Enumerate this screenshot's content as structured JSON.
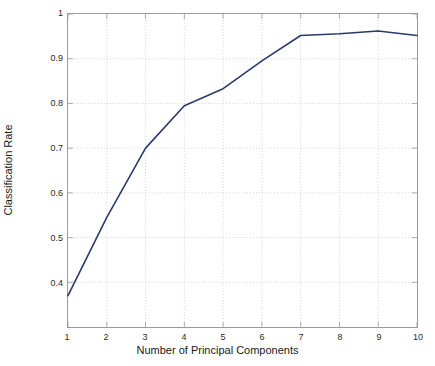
{
  "chart_data": {
    "type": "line",
    "title": "",
    "xlabel": "Number of Principal Components",
    "ylabel": "Classification Rate",
    "x": [
      1,
      2,
      3,
      4,
      5,
      6,
      7,
      8,
      9,
      10
    ],
    "values": [
      0.37,
      0.545,
      0.7,
      0.795,
      0.833,
      0.895,
      0.952,
      0.956,
      0.962,
      0.952
    ],
    "series": [
      {
        "name": "Classification Rate",
        "color": "#2a3a6b",
        "values": [
          0.37,
          0.545,
          0.7,
          0.795,
          0.833,
          0.895,
          0.952,
          0.956,
          0.962,
          0.952
        ]
      }
    ],
    "xlim": [
      1,
      10
    ],
    "ylim": [
      0.3,
      1.0
    ],
    "xticks": [
      1,
      2,
      3,
      4,
      5,
      6,
      7,
      8,
      9,
      10
    ],
    "xtick_labels": [
      "1",
      "2",
      "3",
      "4",
      "5",
      "6",
      "7",
      "8",
      "9",
      "10"
    ],
    "yticks": [
      0.4,
      0.5,
      0.6,
      0.7,
      0.8,
      0.9,
      1.0
    ],
    "ytick_labels": [
      "0.4",
      "0.5",
      "0.6",
      "0.7",
      "0.8",
      "0.9",
      "1"
    ],
    "grid": true,
    "grid_style": "dotted",
    "grid_color": "#bfbfbf",
    "legend": null,
    "legend_position": "none",
    "line_width": 1.6,
    "marker": "none",
    "background": "#ffffff",
    "axis_color": "#9a9a9a"
  }
}
